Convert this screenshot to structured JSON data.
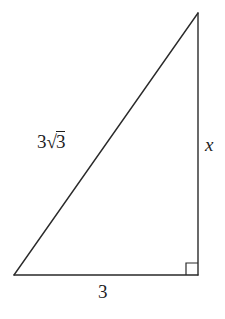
{
  "diagram": {
    "type": "right-triangle",
    "vertices": {
      "bottom_left": [
        14,
        275
      ],
      "bottom_right": [
        198,
        275
      ],
      "top": [
        198,
        13
      ]
    },
    "right_angle_at": "bottom_right",
    "right_angle_marker_size": 12,
    "line_color": "#2a2a2a",
    "labels": {
      "hypotenuse": {
        "coefficient": "3",
        "radical_symbol": "√",
        "radicand": "3",
        "full_text": "3√3"
      },
      "vertical_leg": "x",
      "base": "3"
    }
  }
}
